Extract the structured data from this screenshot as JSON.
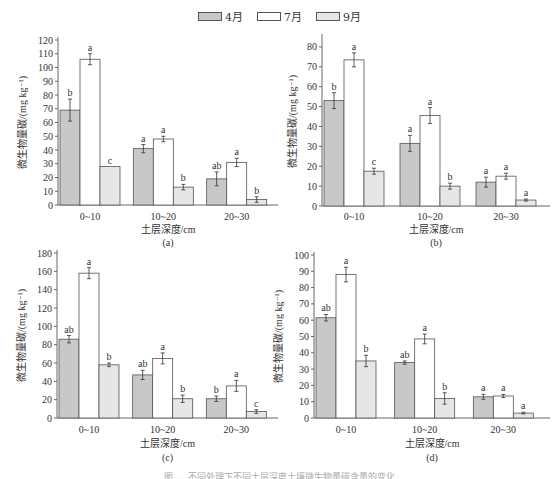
{
  "legend": [
    {
      "label": "4月",
      "color": "#c8c8c8"
    },
    {
      "label": "7月",
      "color": "#ffffff"
    },
    {
      "label": "9月",
      "color": "#e6e6e6"
    }
  ],
  "chart_data": [
    {
      "type": "bar",
      "panel": "(a)",
      "title": "",
      "xlabel": "土层深度/cm",
      "ylabel": "微生物量碳/(mg kg⁻¹)",
      "categories": [
        "0~10",
        "10~20",
        "20~30"
      ],
      "ylim": [
        0,
        120
      ],
      "yticks": [
        0,
        10,
        20,
        30,
        40,
        50,
        60,
        70,
        80,
        90,
        100,
        110,
        120
      ],
      "grid": false,
      "legend_position": "top",
      "series": [
        {
          "name": "4月",
          "values": [
            69,
            41,
            19
          ],
          "errors": [
            8,
            3,
            5
          ],
          "letters": [
            "b",
            "a",
            "ab"
          ]
        },
        {
          "name": "7月",
          "values": [
            106,
            48,
            31
          ],
          "errors": [
            4,
            2,
            3
          ],
          "letters": [
            "a",
            "a",
            "a"
          ]
        },
        {
          "name": "9月",
          "values": [
            28,
            13,
            4
          ],
          "errors": [
            0,
            2,
            2
          ],
          "letters": [
            "c",
            "b",
            "b"
          ]
        }
      ]
    },
    {
      "type": "bar",
      "panel": "(b)",
      "title": "",
      "xlabel": "土层深度/cm",
      "ylabel": "微生物量碳/(mg kg⁻¹)",
      "categories": [
        "0~10",
        "10~20",
        "20~30"
      ],
      "ylim": [
        0,
        85
      ],
      "yticks": [
        0,
        10,
        20,
        30,
        40,
        50,
        60,
        70,
        80
      ],
      "grid": false,
      "legend_position": "top",
      "series": [
        {
          "name": "4月",
          "values": [
            53,
            31.5,
            12
          ],
          "errors": [
            4,
            4,
            2.5
          ],
          "letters": [
            "b",
            "a",
            "a"
          ]
        },
        {
          "name": "7月",
          "values": [
            73.5,
            45.5,
            15
          ],
          "errors": [
            3.5,
            4,
            1.5
          ],
          "letters": [
            "a",
            "a",
            "a"
          ]
        },
        {
          "name": "9月",
          "values": [
            17.5,
            10,
            3
          ],
          "errors": [
            1.5,
            1.5,
            0.5
          ],
          "letters": [
            "c",
            "b",
            "a"
          ]
        }
      ]
    },
    {
      "type": "bar",
      "panel": "(c)",
      "title": "",
      "xlabel": "土层深度/cm",
      "ylabel": "微生物量碳/(mg kg⁻¹)",
      "categories": [
        "0~10",
        "10~20",
        "20~30"
      ],
      "ylim": [
        0,
        180
      ],
      "yticks": [
        0,
        20,
        40,
        60,
        80,
        100,
        120,
        140,
        160,
        180
      ],
      "grid": false,
      "legend_position": "top",
      "series": [
        {
          "name": "4月",
          "values": [
            86,
            47,
            21
          ],
          "errors": [
            4,
            5,
            3
          ],
          "letters": [
            "ab",
            "ab",
            "b"
          ]
        },
        {
          "name": "7月",
          "values": [
            158,
            65,
            35
          ],
          "errors": [
            6,
            6,
            6
          ],
          "letters": [
            "a",
            "a",
            "a"
          ]
        },
        {
          "name": "9月",
          "values": [
            58,
            21,
            7
          ],
          "errors": [
            2,
            4,
            2
          ],
          "letters": [
            "b",
            "b",
            "c"
          ]
        }
      ]
    },
    {
      "type": "bar",
      "panel": "(d)",
      "title": "",
      "xlabel": "土层深度/cm",
      "ylabel": "微生物量碳/(mg kg⁻¹)",
      "categories": [
        "0~10",
        "10~20",
        "20~30"
      ],
      "ylim": [
        0,
        100
      ],
      "yticks": [
        0,
        10,
        20,
        30,
        40,
        50,
        60,
        70,
        80,
        90,
        100
      ],
      "grid": false,
      "legend_position": "top",
      "series": [
        {
          "name": "4月",
          "values": [
            61.5,
            34,
            13
          ],
          "errors": [
            2,
            1,
            1.5
          ],
          "letters": [
            "ab",
            "ab",
            "a"
          ]
        },
        {
          "name": "7月",
          "values": [
            88,
            48.5,
            13.5
          ],
          "errors": [
            4.5,
            3,
            1
          ],
          "letters": [
            "a",
            "a",
            "a"
          ]
        },
        {
          "name": "9月",
          "values": [
            35,
            12,
            3
          ],
          "errors": [
            3.5,
            3.5,
            0.5
          ],
          "letters": [
            "b",
            "b",
            "a"
          ]
        }
      ]
    }
  ],
  "caption": "图 ... 不同处理下不同土层深度土壤微生物量碳含量的变化"
}
